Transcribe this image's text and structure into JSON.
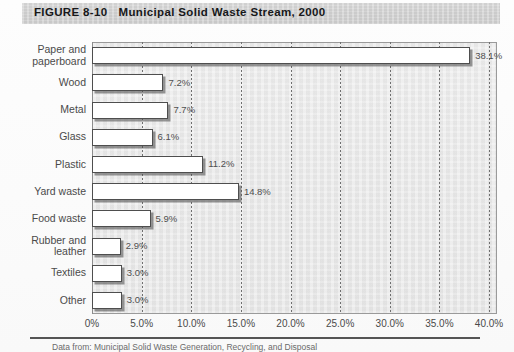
{
  "figure": {
    "number": "FIGURE 8-10",
    "title": "Municipal Solid Waste Stream, 2000"
  },
  "source": {
    "text": "Data from: Municipal Solid Waste Generation, Recycling, and Disposal"
  },
  "colors": {
    "header_band": "#d2d2d2",
    "plot_background": "#e9e9e9",
    "plot_border": "#9a9a9a",
    "bar_fill": "#ffffff",
    "bar_border": "#4e4e4e",
    "gridline": "#6f6f6f",
    "text": "#4a4a4a",
    "title_text": "#17181a"
  },
  "chart_data": {
    "type": "bar",
    "orientation": "horizontal",
    "title": "Municipal Solid Waste Stream, 2000",
    "xlabel": "",
    "ylabel": "",
    "xlim": [
      0,
      40
    ],
    "grid": true,
    "legend": false,
    "xticks": [
      0,
      5,
      10,
      15,
      20,
      25,
      30,
      35,
      40
    ],
    "xticklabels": [
      "0%",
      "5.0%",
      "10.0%",
      "15.0%",
      "20.0%",
      "25.0%",
      "30.0%",
      "35.0%",
      "40.0%"
    ],
    "categories": [
      "Paper and paperboard",
      "Wood",
      "Metal",
      "Glass",
      "Plastic",
      "Yard waste",
      "Food waste",
      "Rubber and leather",
      "Textiles",
      "Other"
    ],
    "category_lines": [
      [
        "Paper and",
        "paperboard"
      ],
      [
        "Wood"
      ],
      [
        "Metal"
      ],
      [
        "Glass"
      ],
      [
        "Plastic"
      ],
      [
        "Yard waste"
      ],
      [
        "Food waste"
      ],
      [
        "Rubber and",
        "leather"
      ],
      [
        "Textiles"
      ],
      [
        "Other"
      ]
    ],
    "values": [
      38.1,
      7.2,
      7.7,
      6.1,
      11.2,
      14.8,
      5.9,
      2.9,
      3.0,
      3.0
    ],
    "value_labels": [
      "38.1%",
      "7.2%",
      "7.7%",
      "6.1%",
      "11.2%",
      "14.8%",
      "5.9%",
      "2.9%",
      "3.0%",
      "3.0%"
    ]
  }
}
